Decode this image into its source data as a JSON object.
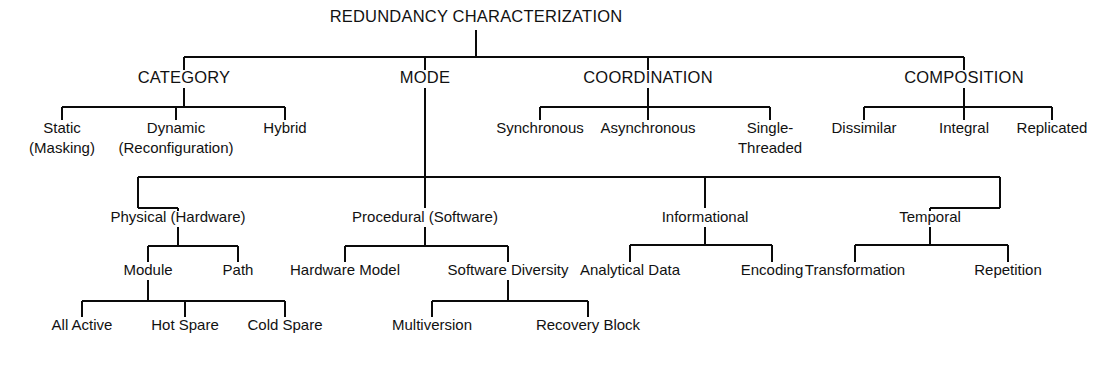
{
  "diagram": {
    "title": "REDUNDANCY CHARACTERIZATION",
    "type": "hierarchy-tree",
    "colors": {
      "line": "#0a0a0a",
      "text": "#111111",
      "background": "#ffffff"
    },
    "root": {
      "label": "REDUNDANCY CHARACTERIZATION",
      "x": 476,
      "y": 22
    },
    "level1": [
      {
        "label": "CATEGORY",
        "x": 184,
        "y": 83
      },
      {
        "label": "MODE",
        "x": 425,
        "y": 83
      },
      {
        "label": "COORDINATION",
        "x": 648,
        "y": 83
      },
      {
        "label": "COMPOSITION",
        "x": 964,
        "y": 83
      }
    ],
    "category_children": [
      {
        "line1": "Static",
        "line2": "(Masking)",
        "x": 62,
        "y": 133
      },
      {
        "line1": "Dynamic",
        "line2": "(Reconfiguration)",
        "x": 176,
        "y": 133
      },
      {
        "line1": "Hybrid",
        "line2": "",
        "x": 285,
        "y": 133
      }
    ],
    "coordination_children": [
      {
        "line1": "Synchronous",
        "line2": "",
        "x": 540,
        "y": 133
      },
      {
        "line1": "Asynchronous",
        "line2": "",
        "x": 648,
        "y": 133
      },
      {
        "line1": "Single-",
        "line2": "Threaded",
        "x": 770,
        "y": 133
      }
    ],
    "composition_children": [
      {
        "line1": "Dissimilar",
        "line2": "",
        "x": 864,
        "y": 133
      },
      {
        "line1": "Integral",
        "line2": "",
        "x": 964,
        "y": 133
      },
      {
        "line1": "Replicated",
        "line2": "",
        "x": 1052,
        "y": 133
      }
    ],
    "mode_children": [
      {
        "label": "Physical (Hardware)",
        "x": 178,
        "y": 222
      },
      {
        "label": "Procedural (Software)",
        "x": 425,
        "y": 222
      },
      {
        "label": "Informational",
        "x": 705,
        "y": 222
      },
      {
        "label": "Temporal",
        "x": 930,
        "y": 222
      }
    ],
    "physical_children": [
      {
        "label": "Module",
        "x": 148,
        "y": 275
      },
      {
        "label": "Path",
        "x": 238,
        "y": 275
      }
    ],
    "procedural_children": [
      {
        "label": "Hardware Model",
        "x": 345,
        "y": 275
      },
      {
        "label": "Software Diversity",
        "x": 508,
        "y": 275
      }
    ],
    "informational_children": [
      {
        "label": "Analytical Data",
        "x": 630,
        "y": 275
      },
      {
        "label": "Encoding",
        "x": 772,
        "y": 275
      }
    ],
    "temporal_children": [
      {
        "label": "Transformation",
        "x": 855,
        "y": 275
      },
      {
        "label": "Repetition",
        "x": 1008,
        "y": 275
      }
    ],
    "module_children": [
      {
        "label": "All Active",
        "x": 82,
        "y": 330
      },
      {
        "label": "Hot Spare",
        "x": 185,
        "y": 330
      },
      {
        "label": "Cold Spare",
        "x": 285,
        "y": 330
      }
    ],
    "software_diversity_children": [
      {
        "label": "Multiversion",
        "x": 432,
        "y": 330
      },
      {
        "label": "Recovery Block",
        "x": 588,
        "y": 330
      }
    ]
  }
}
